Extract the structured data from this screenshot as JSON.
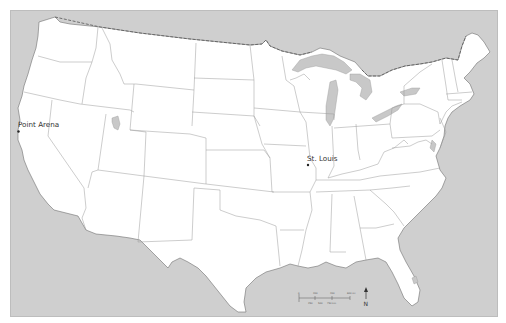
{
  "map": {
    "title": "",
    "region": "Contiguous United States",
    "colors": {
      "water": "#cfcfcf",
      "land": "#ffffff",
      "state_border": "#9a9a9a",
      "coast": "#6f6f6f",
      "point": "#222222",
      "label": "#333333"
    },
    "places": [
      {
        "name": "Point Arena",
        "x": 18,
        "y": 131
      },
      {
        "name": "St. Louis",
        "x": 308,
        "y": 164
      }
    ],
    "scale_bar": {
      "top_labels": [
        "0",
        "200",
        "400",
        "600 mi"
      ],
      "bottom_labels": [
        "250",
        "500",
        "750 km"
      ]
    },
    "north_arrow": {
      "label": "N"
    }
  }
}
